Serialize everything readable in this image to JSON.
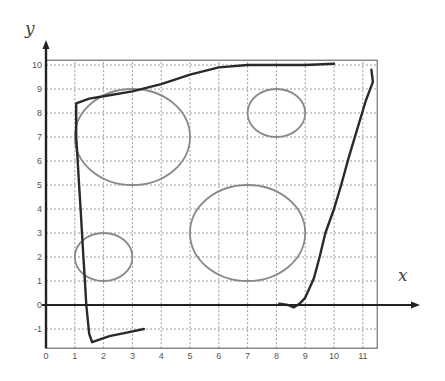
{
  "figure": {
    "type": "coordinate-plane-diagram",
    "x_axis_label": "x",
    "y_axis_label": "y",
    "x_ticks": [
      "0",
      "1",
      "2",
      "3",
      "4",
      "5",
      "6",
      "7",
      "8",
      "9",
      "10",
      "11"
    ],
    "y_ticks": [
      "10",
      "9",
      "8",
      "7",
      "6",
      "5",
      "4",
      "3",
      "2",
      "1",
      "0",
      "-1"
    ],
    "grid": {
      "x_range": [
        0,
        11.5
      ],
      "y_range": [
        -1.8,
        10.2
      ],
      "style": "dotted"
    },
    "circles": [
      {
        "cx": 3,
        "cy": 7,
        "r": 2
      },
      {
        "cx": 8,
        "cy": 8,
        "r": 1
      },
      {
        "cx": 7,
        "cy": 3,
        "r": 2
      },
      {
        "cx": 2,
        "cy": 2,
        "r": 1
      }
    ],
    "hand_drawn_path": [
      [
        3.4,
        -1.0
      ],
      [
        2.8,
        -1.15
      ],
      [
        2.2,
        -1.3
      ],
      [
        1.6,
        -1.55
      ],
      [
        1.5,
        -1.2
      ],
      [
        1.4,
        0
      ],
      [
        1.35,
        1
      ],
      [
        1.3,
        2
      ],
      [
        1.25,
        3
      ],
      [
        1.2,
        4
      ],
      [
        1.15,
        5
      ],
      [
        1.1,
        6
      ],
      [
        1.05,
        7
      ],
      [
        1.05,
        7.6
      ],
      [
        1.05,
        8.4
      ],
      [
        1.5,
        8.6
      ],
      [
        2,
        8.7
      ],
      [
        3,
        8.9
      ],
      [
        4,
        9.2
      ],
      [
        5,
        9.6
      ],
      [
        6,
        9.9
      ],
      [
        7,
        10.0
      ],
      [
        8,
        10.0
      ],
      [
        9,
        10.0
      ],
      [
        10,
        10.05
      ]
    ],
    "right_path": [
      [
        11.3,
        9.8
      ],
      [
        11.35,
        9.3
      ],
      [
        11.1,
        8.5
      ],
      [
        10.8,
        7.3
      ],
      [
        10.5,
        6.1
      ],
      [
        10.25,
        5.0
      ],
      [
        10,
        4.0
      ],
      [
        9.7,
        3.0
      ],
      [
        9.5,
        2.0
      ],
      [
        9.3,
        1.1
      ],
      [
        9.0,
        0.3
      ],
      [
        8.8,
        0.05
      ],
      [
        8.6,
        -0.1
      ],
      [
        8.4,
        0
      ],
      [
        8.1,
        0.05
      ]
    ],
    "colors": {
      "axis": "#222222",
      "grid": "#9a9a9a",
      "circle": "#8a8a8a",
      "path": "#2a2a2a",
      "frame": "#555555"
    }
  }
}
